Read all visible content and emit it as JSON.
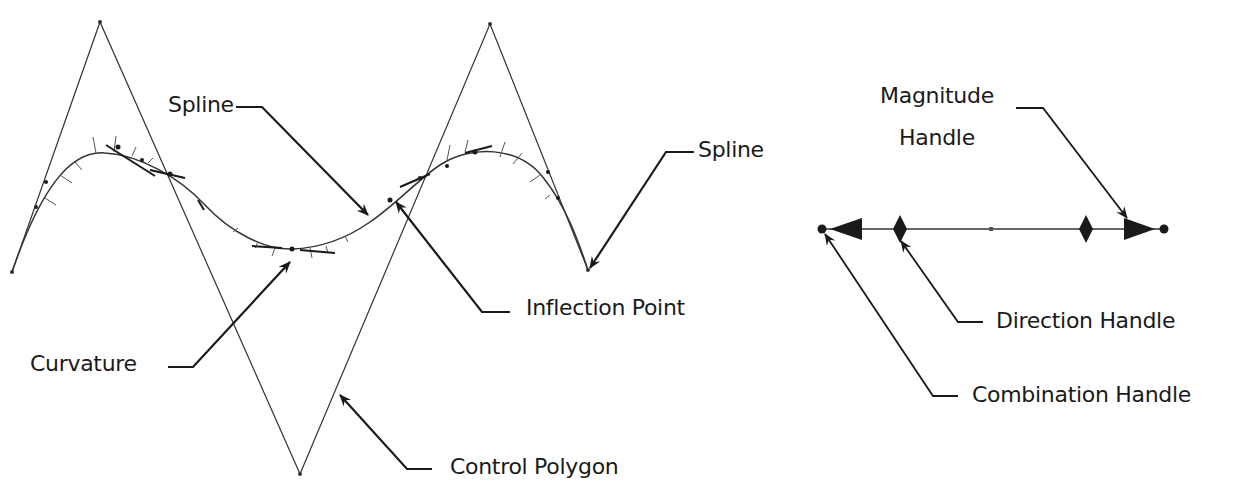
{
  "diagram": {
    "colors": {
      "background": "#ffffff",
      "stroke": "#1a1a1a",
      "thin_stroke": "#333333",
      "text": "#1a1a1a"
    },
    "left_figure": {
      "labels": {
        "spline_top": "Spline",
        "spline_right": "Spline",
        "inflection_point": "Inflection Point",
        "curvature": "Curvature",
        "control_polygon": "Control Polygon"
      },
      "control_polygon_points": [
        [
          12,
          272
        ],
        [
          100,
          22
        ],
        [
          300,
          474
        ],
        [
          490,
          24
        ],
        [
          588,
          270
        ]
      ],
      "elements": [
        "spline-curve",
        "control-polygon",
        "curvature-combs",
        "inflection-point-marker"
      ]
    },
    "right_figure": {
      "labels": {
        "magnitude_handle_line1": "Magnitude",
        "magnitude_handle_line2": "Handle",
        "direction_handle": "Direction Handle",
        "combination_handle": "Combination Handle"
      },
      "handle_elements": [
        "combination-handle-left",
        "magnitude-arrow-left",
        "direction-diamond-left",
        "midpoint",
        "direction-diamond-right",
        "magnitude-arrow-right",
        "combination-handle-right"
      ]
    }
  }
}
